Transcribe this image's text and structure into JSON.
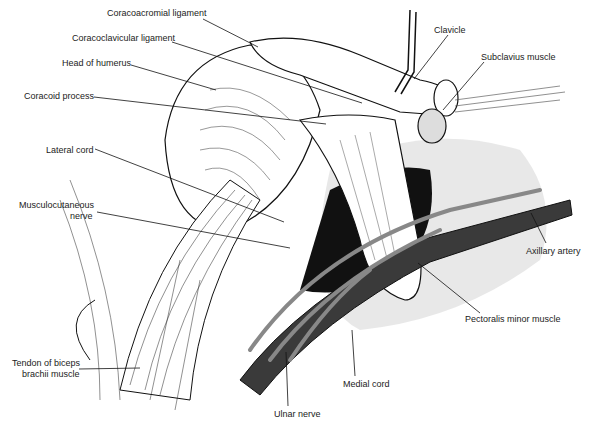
{
  "figure": {
    "labels": [
      {
        "id": "coracoacromial",
        "text": "Coracoacromial ligament",
        "x": 107,
        "y": 12,
        "ax": 203,
        "ay": 19,
        "px": 258,
        "py": 47
      },
      {
        "id": "coracoclavicular",
        "text": "Coracoclavicular ligament",
        "x": 72,
        "y": 37,
        "ax": 172,
        "ay": 42,
        "px": 362,
        "py": 103
      },
      {
        "id": "humerus",
        "text": "Head of humerus",
        "x": 62,
        "y": 60,
        "ax": 131,
        "ay": 65,
        "px": 216,
        "py": 90
      },
      {
        "id": "coracoid",
        "text": "Coracoid process",
        "x": 24,
        "y": 92,
        "ax": 94,
        "ay": 97,
        "px": 326,
        "py": 124
      },
      {
        "id": "clavicle",
        "text": "Clavicle",
        "x": 434,
        "y": 24,
        "ax": 448,
        "ay": 35,
        "px": 414,
        "py": 79
      },
      {
        "id": "subclavius",
        "text": "Subclavius muscle",
        "x": 481,
        "y": 51,
        "ax": 484,
        "ay": 62,
        "px": 443,
        "py": 110
      },
      {
        "id": "lateral_cord",
        "text": "Lateral cord",
        "x": 46,
        "y": 144,
        "ax": 95,
        "ay": 149,
        "px": 284,
        "py": 222
      },
      {
        "id": "musculocutaneous_1",
        "text": "Musculocutaneous",
        "x": 20,
        "y": 200,
        "ax": null,
        "ay": null,
        "px": null,
        "py": null
      },
      {
        "id": "musculocutaneous_2",
        "text": "nerve",
        "x": 71,
        "y": 211,
        "ax": 97,
        "ay": 212,
        "px": 290,
        "py": 248
      },
      {
        "id": "axillary_artery",
        "text": "Axillary artery",
        "x": 526,
        "y": 245,
        "ax": 546,
        "ay": 243,
        "px": 531,
        "py": 213
      },
      {
        "id": "pectoralis",
        "text": "Pectoralis minor muscle",
        "x": 468,
        "y": 313,
        "ax": 480,
        "ay": 313,
        "px": 418,
        "py": 263
      },
      {
        "id": "biceps_1",
        "text": "Tendon of biceps",
        "x": 12,
        "y": 358,
        "ax": null,
        "ay": null,
        "px": null,
        "py": null
      },
      {
        "id": "biceps_2",
        "text": "brachii muscle",
        "x": 22,
        "y": 369,
        "ax": 79,
        "ay": 369,
        "px": 140,
        "py": 368
      },
      {
        "id": "medial_cord",
        "text": "Medial cord",
        "x": 343,
        "y": 379,
        "ax": 355,
        "ay": 376,
        "px": 352,
        "py": 330
      },
      {
        "id": "ulnar_nerve",
        "text": "Ulnar nerve",
        "x": 275,
        "y": 409,
        "ax": 288,
        "ay": 406,
        "px": 286,
        "py": 352
      }
    ]
  },
  "colors": {
    "ink": "#111111",
    "artery": "#3a3a3a",
    "shade": "#8a8a8a",
    "paper": "#ffffff"
  }
}
